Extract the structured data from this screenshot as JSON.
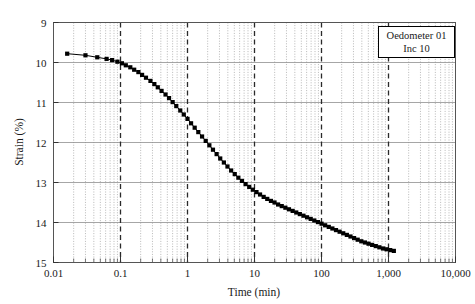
{
  "chart_data": {
    "type": "scatter",
    "title": "",
    "xlabel": "Time (min)",
    "ylabel": "Strain (%)",
    "xscale": "log",
    "yscale": "linear",
    "xlim": [
      0.01,
      10000
    ],
    "ylim": [
      15,
      9
    ],
    "y_inverted": true,
    "grid": {
      "major_x": "dashed dark vertical lines at each decade",
      "minor_x": "dotted light vertical lines at log subdivisions",
      "major_y": "light horizontal lines at each integer strain"
    },
    "xticks": [
      0.01,
      0.1,
      1,
      10,
      100,
      1000,
      10000
    ],
    "xtick_labels": [
      "0.01",
      "0.1",
      "1",
      "10",
      "100",
      "1,000",
      "10,000"
    ],
    "yticks": [
      9,
      10,
      11,
      12,
      13,
      14,
      15
    ],
    "ytick_labels": [
      "9",
      "10",
      "11",
      "12",
      "13",
      "14",
      "15"
    ],
    "legend_position": "top-right",
    "marker": "filled-square",
    "marker_color": "#000000",
    "line_color": "#000000",
    "series": [
      {
        "name": "Oedometer 01 Inc 10",
        "x": [
          0.016,
          0.03,
          0.045,
          0.062,
          0.075,
          0.09,
          0.105,
          0.12,
          0.14,
          0.16,
          0.185,
          0.21,
          0.24,
          0.28,
          0.32,
          0.36,
          0.41,
          0.47,
          0.53,
          0.6,
          0.68,
          0.78,
          0.88,
          1.0,
          1.13,
          1.28,
          1.45,
          1.65,
          1.87,
          2.12,
          2.4,
          2.72,
          3.08,
          3.49,
          3.95,
          4.48,
          5.07,
          5.74,
          6.5,
          7.36,
          8.34,
          9.44,
          10.7,
          12.1,
          13.7,
          15.5,
          17.6,
          19.9,
          22.5,
          25.5,
          28.9,
          32.7,
          37.1,
          42.0,
          47.5,
          53.8,
          60.9,
          69.0,
          78.1,
          88.5,
          100.2,
          113.4,
          128.4,
          145.4,
          164.6,
          186.4,
          211.1,
          239.0,
          270.6,
          306.4,
          346.9,
          392.8,
          444.8,
          503.6,
          570.2,
          645.6,
          731.0,
          827.7,
          937.2,
          1061.2,
          1201.6
        ],
        "y": [
          9.78,
          9.82,
          9.87,
          9.91,
          9.94,
          9.98,
          10.02,
          10.07,
          10.12,
          10.18,
          10.24,
          10.31,
          10.38,
          10.46,
          10.54,
          10.62,
          10.71,
          10.8,
          10.89,
          10.99,
          11.09,
          11.2,
          11.3,
          11.41,
          11.52,
          11.63,
          11.74,
          11.85,
          11.96,
          12.07,
          12.18,
          12.29,
          12.4,
          12.5,
          12.6,
          12.7,
          12.79,
          12.88,
          12.96,
          13.04,
          13.11,
          13.18,
          13.24,
          13.3,
          13.36,
          13.41,
          13.46,
          13.5,
          13.55,
          13.59,
          13.63,
          13.67,
          13.71,
          13.75,
          13.79,
          13.83,
          13.87,
          13.91,
          13.95,
          13.99,
          14.03,
          14.07,
          14.11,
          14.15,
          14.19,
          14.23,
          14.27,
          14.31,
          14.35,
          14.39,
          14.43,
          14.47,
          14.5,
          14.53,
          14.56,
          14.59,
          14.62,
          14.65,
          14.67,
          14.69,
          14.71
        ]
      }
    ]
  },
  "legend": {
    "line1": "Oedometer 01",
    "line2": "Inc 10"
  },
  "axes": {
    "x_title": "Time (min)",
    "y_title": "Strain (%)"
  }
}
